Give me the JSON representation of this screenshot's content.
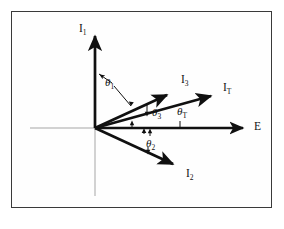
{
  "figure": {
    "type": "phasor-diagram",
    "background_color": "#ffffff",
    "frame_color": "#3a3a3a",
    "vector_color": "#101010",
    "axis_color": "#9a9a9a",
    "origin": {
      "x": 95,
      "y": 128
    }
  },
  "axes": {
    "horizontal": {
      "label": "E",
      "label_x": 254,
      "label_y": 121,
      "arrow_tip_x": 248,
      "arrow_tip_y": 128,
      "gray_left_x": 30
    },
    "vertical": {
      "gray_bottom_y": 196
    }
  },
  "vectors": [
    {
      "name": "I1",
      "label": "I",
      "sub": "1",
      "angle_deg": 90,
      "tip_x": 95,
      "tip_y": 30,
      "label_x": 79,
      "label_y": 23
    },
    {
      "name": "I3",
      "label": "I",
      "sub": "3",
      "angle_deg": 21,
      "tip_x": 173,
      "tip_y": 91,
      "label_x": 181,
      "label_y": 74
    },
    {
      "name": "IT",
      "label": "I",
      "sub": "T",
      "angle_deg": 13,
      "tip_x": 217,
      "tip_y": 93,
      "label_x": 223,
      "label_y": 82
    },
    {
      "name": "I2",
      "label": "I",
      "sub": "2",
      "angle_deg": -25,
      "tip_x": 179,
      "tip_y": 168,
      "label_x": 186,
      "label_y": 168
    }
  ],
  "angles": [
    {
      "name": "theta1",
      "label": "θ",
      "sub": "1",
      "label_x": 105,
      "label_y": 77,
      "between": [
        "I1",
        "I3"
      ]
    },
    {
      "name": "theta3",
      "label": "θ",
      "sub": "3",
      "label_x": 152,
      "label_y": 107,
      "between": [
        "I3",
        "E"
      ]
    },
    {
      "name": "thetaT",
      "label": "θ",
      "sub": "T",
      "label_x": 177,
      "label_y": 106,
      "between": [
        "IT",
        "E"
      ]
    },
    {
      "name": "theta2",
      "label": "θ",
      "sub": "2",
      "label_x": 146,
      "label_y": 138,
      "between": [
        "E",
        "I2"
      ]
    }
  ]
}
